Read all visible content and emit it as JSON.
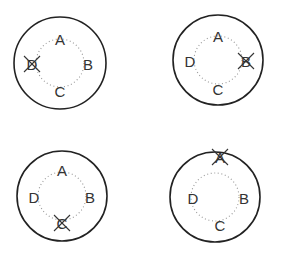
{
  "diagrams": [
    {
      "id": "top-left",
      "center": [
        60,
        63
      ],
      "outer_radius": 46,
      "inner_radius": 24,
      "labels": [
        {
          "text": "A",
          "pos": [
            60,
            39
          ]
        },
        {
          "text": "B",
          "pos": [
            88,
            64
          ]
        },
        {
          "text": "C",
          "pos": [
            60,
            91
          ]
        },
        {
          "text": "D",
          "pos": [
            32,
            64
          ],
          "crossed": true
        }
      ]
    },
    {
      "id": "top-right",
      "center": [
        218,
        60
      ],
      "outer_radius": 45,
      "inner_radius": 24,
      "labels": [
        {
          "text": "A",
          "pos": [
            218,
            36
          ]
        },
        {
          "text": "B",
          "pos": [
            246,
            61
          ],
          "crossed": true
        },
        {
          "text": "C",
          "pos": [
            218,
            89
          ]
        },
        {
          "text": "D",
          "pos": [
            190,
            61
          ]
        }
      ]
    },
    {
      "id": "bottom-left",
      "center": [
        62,
        196
      ],
      "outer_radius": 45,
      "inner_radius": 24,
      "labels": [
        {
          "text": "A",
          "pos": [
            62,
            170
          ]
        },
        {
          "text": "B",
          "pos": [
            90,
            197
          ]
        },
        {
          "text": "C",
          "pos": [
            62,
            223
          ],
          "crossed": true
        },
        {
          "text": "D",
          "pos": [
            34,
            197
          ]
        }
      ]
    },
    {
      "id": "bottom-right",
      "center": [
        215,
        197
      ],
      "outer_radius": 45,
      "inner_radius": 24,
      "labels": [
        {
          "text": "A",
          "pos": [
            220,
            157
          ],
          "crossed": true
        },
        {
          "text": "B",
          "pos": [
            244,
            198
          ]
        },
        {
          "text": "C",
          "pos": [
            220,
            225
          ]
        },
        {
          "text": "D",
          "pos": [
            193,
            198
          ]
        }
      ]
    }
  ]
}
